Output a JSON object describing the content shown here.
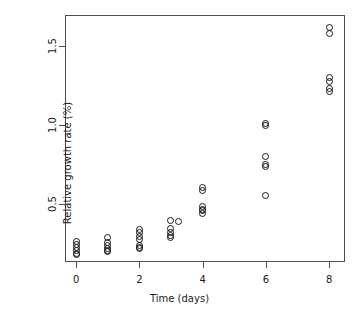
{
  "chart_data": {
    "type": "scatter",
    "title": "",
    "xlabel": "Time (days)",
    "ylabel": "Relative growth rate (%)",
    "xlim": [
      -0.35,
      8.5
    ],
    "ylim": [
      0.13,
      1.7
    ],
    "xticks": [
      0,
      2,
      4,
      6,
      8
    ],
    "xticklabels": [
      "0",
      "2",
      "4",
      "6",
      "8"
    ],
    "yticks": [
      0.5,
      1.0,
      1.5
    ],
    "yticklabels": [
      "0.5",
      "1.0",
      "1.5"
    ],
    "grid": false,
    "legend": null,
    "marker": "open-circle",
    "marker_color": "#1a1a1a",
    "points": [
      {
        "x": 0,
        "y": 0.26
      },
      {
        "x": 0,
        "y": 0.24
      },
      {
        "x": 0,
        "y": 0.22
      },
      {
        "x": 0,
        "y": 0.2
      },
      {
        "x": 0,
        "y": 0.185
      },
      {
        "x": 0,
        "y": 0.175
      },
      {
        "x": 1,
        "y": 0.285
      },
      {
        "x": 1,
        "y": 0.255
      },
      {
        "x": 1,
        "y": 0.235
      },
      {
        "x": 1,
        "y": 0.215
      },
      {
        "x": 1,
        "y": 0.205
      },
      {
        "x": 1,
        "y": 0.195
      },
      {
        "x": 2,
        "y": 0.335
      },
      {
        "x": 2,
        "y": 0.315
      },
      {
        "x": 2,
        "y": 0.295
      },
      {
        "x": 2,
        "y": 0.275
      },
      {
        "x": 2,
        "y": 0.235
      },
      {
        "x": 2,
        "y": 0.225
      },
      {
        "x": 2,
        "y": 0.215
      },
      {
        "x": 3,
        "y": 0.395
      },
      {
        "x": 3,
        "y": 0.345
      },
      {
        "x": 3,
        "y": 0.315
      },
      {
        "x": 3,
        "y": 0.3
      },
      {
        "x": 3,
        "y": 0.285
      },
      {
        "x": 3.25,
        "y": 0.385
      },
      {
        "x": 4,
        "y": 0.605
      },
      {
        "x": 4,
        "y": 0.585
      },
      {
        "x": 4,
        "y": 0.48
      },
      {
        "x": 4,
        "y": 0.465
      },
      {
        "x": 4,
        "y": 0.455
      },
      {
        "x": 4,
        "y": 0.44
      },
      {
        "x": 6,
        "y": 1.01
      },
      {
        "x": 6,
        "y": 0.995
      },
      {
        "x": 6,
        "y": 0.8
      },
      {
        "x": 6,
        "y": 0.75
      },
      {
        "x": 6,
        "y": 0.74
      },
      {
        "x": 6,
        "y": 0.555
      },
      {
        "x": 8,
        "y": 1.62
      },
      {
        "x": 8,
        "y": 1.58
      },
      {
        "x": 8,
        "y": 1.305
      },
      {
        "x": 8,
        "y": 1.275
      },
      {
        "x": 8,
        "y": 1.235
      },
      {
        "x": 8,
        "y": 1.215
      }
    ]
  }
}
